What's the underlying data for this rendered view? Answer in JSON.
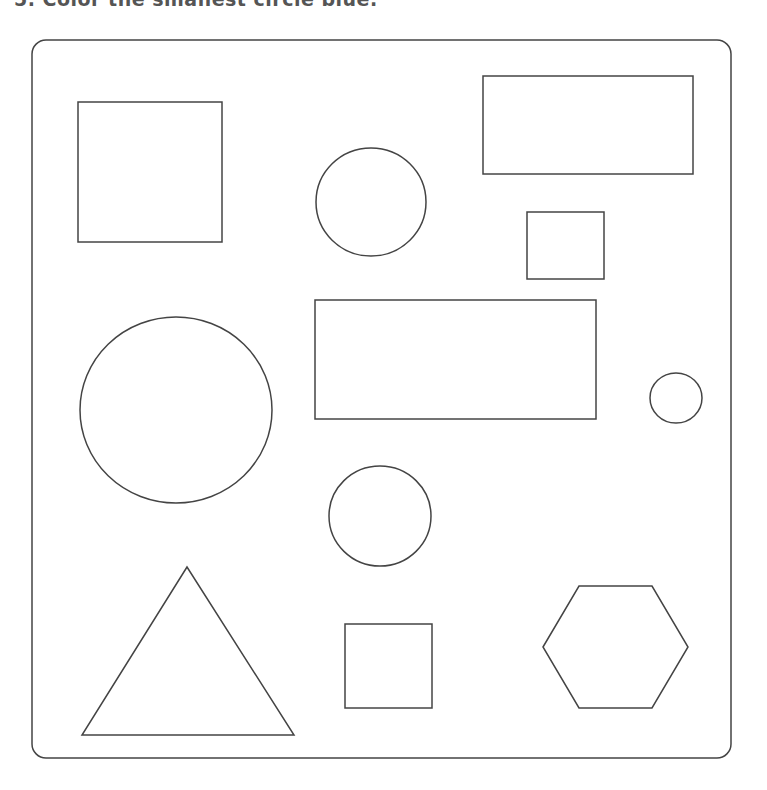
{
  "instruction": {
    "text": "5.  Color the smallest circle blue."
  },
  "frame": {
    "x": 32,
    "y": 40,
    "width": 699,
    "height": 718,
    "radius": 14
  },
  "stroke_color": "#444444",
  "shapes": [
    {
      "id": "square-top-left",
      "type": "rect",
      "x": 78,
      "y": 102,
      "w": 144,
      "h": 140
    },
    {
      "id": "rectangle-top-right",
      "type": "rect",
      "x": 483,
      "y": 76,
      "w": 210,
      "h": 98
    },
    {
      "id": "circle-top-middle",
      "type": "ellipse",
      "cx": 371,
      "cy": 202,
      "rx": 55,
      "ry": 54
    },
    {
      "id": "square-small-right",
      "type": "rect",
      "x": 527,
      "y": 212,
      "w": 77,
      "h": 67
    },
    {
      "id": "circle-large-left",
      "type": "ellipse",
      "cx": 176,
      "cy": 410,
      "rx": 96,
      "ry": 93
    },
    {
      "id": "rectangle-middle",
      "type": "rect",
      "x": 315,
      "y": 300,
      "w": 281,
      "h": 119
    },
    {
      "id": "circle-smallest-right",
      "type": "ellipse",
      "cx": 676,
      "cy": 398,
      "rx": 26,
      "ry": 25
    },
    {
      "id": "circle-lower-middle",
      "type": "ellipse",
      "cx": 380,
      "cy": 516,
      "rx": 51,
      "ry": 50
    },
    {
      "id": "triangle-bottom-left",
      "type": "polygon",
      "points": "187,567 294,735 82,735"
    },
    {
      "id": "square-bottom-middle",
      "type": "rect",
      "x": 345,
      "y": 624,
      "w": 87,
      "h": 84
    },
    {
      "id": "hexagon-bottom-right",
      "type": "polygon",
      "points": "543,647 579,586 652,586 688,647 652,708 579,708"
    }
  ]
}
